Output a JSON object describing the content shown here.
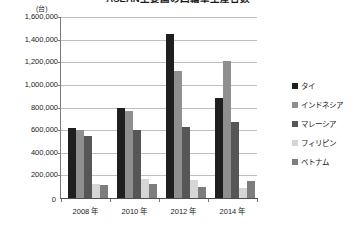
{
  "title": "ASEAN主要国の四輪車生産台数",
  "unit_label": "(台)",
  "zero_label": "0",
  "chart_data": {
    "type": "bar",
    "title": "ASEAN主要国の四輪車生産台数",
    "xlabel": "",
    "ylabel": "(台)",
    "ylim": [
      0,
      1600000
    ],
    "grid": true,
    "legend_position": "right",
    "categories": [
      "2008 年",
      "2010 年",
      "2012 年",
      "2014 年"
    ],
    "ytick_labels": [
      "1,600,000",
      "1,400,000",
      "1,200,000",
      "1,000,000",
      "800,000",
      "600,000",
      "400,000",
      "200,000"
    ],
    "ytick_values": [
      1600000,
      1400000,
      1200000,
      1000000,
      800000,
      600000,
      400000,
      200000
    ],
    "series": [
      {
        "name": "タイ",
        "color": "#1f1f1f",
        "values": [
          620000,
          800000,
          1450000,
          880000
        ]
      },
      {
        "name": "インドネシア",
        "color": "#8f8f8f",
        "values": [
          600000,
          765000,
          1120000,
          1210000
        ]
      },
      {
        "name": "マレーシア",
        "color": "#565656",
        "values": [
          545000,
          600000,
          630000,
          670000
        ]
      },
      {
        "name": "フィリピン",
        "color": "#d6d6d6",
        "values": [
          125000,
          170000,
          160000,
          90000
        ]
      },
      {
        "name": "ベトナム",
        "color": "#7d7d7d",
        "values": [
          115000,
          125000,
          95000,
          150000
        ]
      }
    ]
  }
}
